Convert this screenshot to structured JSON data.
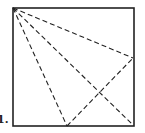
{
  "figure": {
    "label": "1.",
    "square": {
      "x": 13,
      "y": 8,
      "width": 121,
      "height": 118
    },
    "points": {
      "A": {
        "x": 13,
        "y": 8,
        "role": "top-left corner"
      },
      "B": {
        "x": 133,
        "y": 58,
        "role": "point on right side"
      },
      "C": {
        "x": 133,
        "y": 125,
        "role": "bottom-right corner"
      },
      "D": {
        "x": 67,
        "y": 126,
        "role": "point on bottom side"
      }
    },
    "dashed_segments": [
      [
        "A",
        "B"
      ],
      [
        "A",
        "C"
      ],
      [
        "A",
        "D"
      ],
      [
        "D",
        "B"
      ]
    ],
    "stroke_color": "#222222"
  }
}
